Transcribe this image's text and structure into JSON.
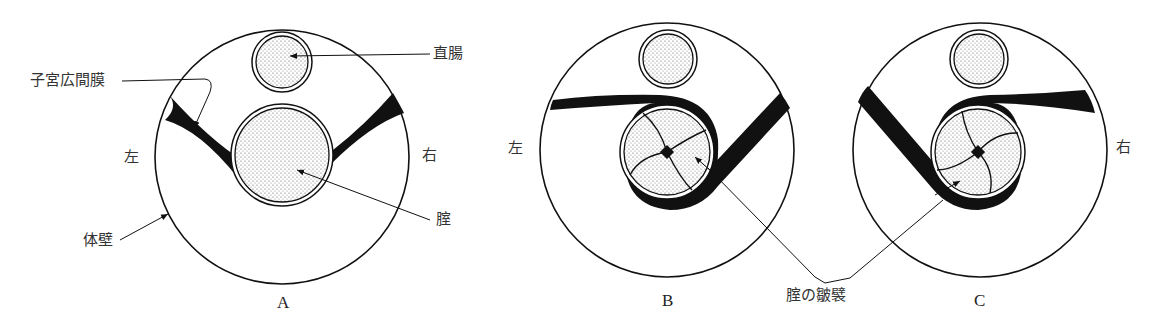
{
  "figure": {
    "panels": [
      {
        "id": "A",
        "label": "A",
        "left": "左",
        "right": "右"
      },
      {
        "id": "B",
        "label": "B",
        "left": "左"
      },
      {
        "id": "C",
        "label": "C",
        "right": "右"
      }
    ],
    "labels": {
      "broad_ligament": "子宮広間膜",
      "rectum": "直腸",
      "vagina": "腟",
      "body_wall": "体壁",
      "vaginal_folds": "腟の皺襞"
    },
    "colors": {
      "ink": "#111111",
      "stipple": "#777777",
      "background": "#ffffff"
    }
  }
}
